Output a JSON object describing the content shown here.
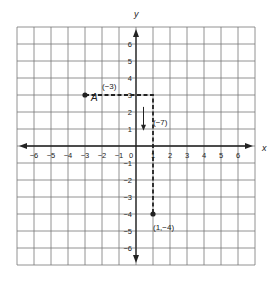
{
  "diagram": {
    "type": "coordinate-plane",
    "axes": {
      "x_label": "x",
      "y_label": "y",
      "x_ticks": [
        "-6",
        "-5",
        "-4",
        "-3",
        "-2",
        "-1",
        "0",
        "1",
        "2",
        "3",
        "4",
        "5",
        "6"
      ],
      "y_ticks": [
        "6",
        "5",
        "4",
        "3",
        "2",
        "1",
        "-1",
        "-2",
        "-3",
        "-4",
        "-5",
        "-6"
      ],
      "range": [
        -7,
        7
      ]
    },
    "points": [
      {
        "name": "A",
        "x": -3,
        "y": 3,
        "label": "A"
      },
      {
        "name": "end",
        "x": 1,
        "y": -4,
        "label": "(1,−4)"
      }
    ],
    "annotations": {
      "horizontal_move": "(−3)",
      "vertical_move": "(−7)"
    },
    "path": [
      {
        "x": -3,
        "y": 3
      },
      {
        "x": 1,
        "y": 3
      },
      {
        "x": 1,
        "y": -4
      }
    ],
    "colors": {
      "grid": "#777777",
      "axis": "#222222",
      "path": "#222222",
      "background": "#ffffff"
    }
  }
}
